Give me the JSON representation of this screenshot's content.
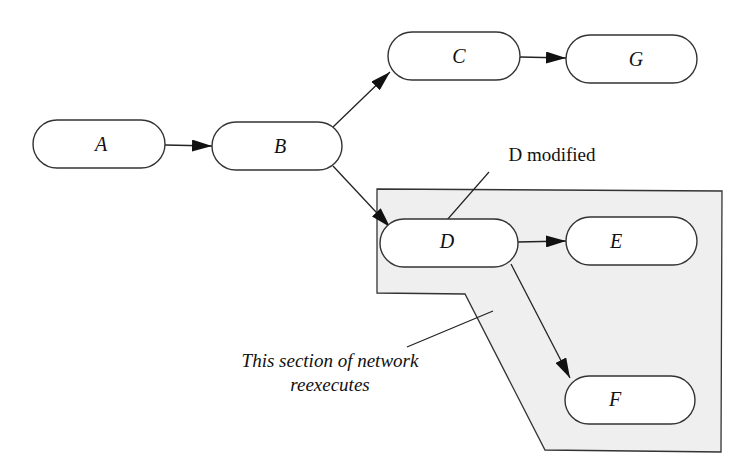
{
  "diagram": {
    "nodes": [
      {
        "id": "A",
        "label": "A"
      },
      {
        "id": "B",
        "label": "B"
      },
      {
        "id": "C",
        "label": "C"
      },
      {
        "id": "G",
        "label": "G"
      },
      {
        "id": "D",
        "label": "D"
      },
      {
        "id": "E",
        "label": "E"
      },
      {
        "id": "F",
        "label": "F"
      }
    ],
    "edges": [
      {
        "from": "A",
        "to": "B"
      },
      {
        "from": "B",
        "to": "C"
      },
      {
        "from": "B",
        "to": "D"
      },
      {
        "from": "C",
        "to": "G"
      },
      {
        "from": "D",
        "to": "E"
      },
      {
        "from": "D",
        "to": "F"
      }
    ],
    "annotations": {
      "modified_label": "D modified",
      "region_label_line1": "This section of network",
      "region_label_line2": "reexecutes"
    },
    "colors": {
      "region_fill": "#efefef",
      "node_fill": "#ffffff",
      "stroke": "#333333"
    }
  }
}
